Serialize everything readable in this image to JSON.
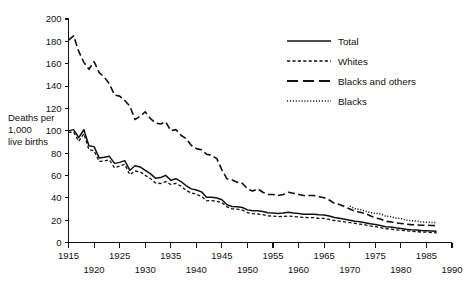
{
  "chart_data": {
    "type": "line",
    "title": "",
    "subtitle": "",
    "xlabel": "",
    "ylabel": "Deaths per 1,000 live births",
    "ylabel_lines": [
      "Deaths per",
      "1,000",
      "live births"
    ],
    "xlim": [
      1915,
      1990
    ],
    "ylim": [
      0,
      200
    ],
    "grid": false,
    "legend_position": "top-right",
    "x_ticks": [
      1915,
      1920,
      1925,
      1930,
      1935,
      1940,
      1945,
      1950,
      1955,
      1960,
      1965,
      1970,
      1975,
      1980,
      1985,
      1990
    ],
    "x_tick_labels_upper": [
      "1915",
      "1925",
      "1935",
      "1945",
      "1955",
      "1965",
      "1975",
      "1985"
    ],
    "x_tick_labels_lower": [
      "1920",
      "1930",
      "1940",
      "1950",
      "1960",
      "1970",
      "1980",
      "1990"
    ],
    "y_ticks": [
      0,
      20,
      40,
      60,
      80,
      100,
      120,
      140,
      160,
      180,
      200
    ],
    "y_tick_labels": [
      "0",
      "20",
      "40",
      "60",
      "80",
      "100",
      "120",
      "140",
      "160",
      "180",
      "200"
    ],
    "series": [
      {
        "name": "Total",
        "line_style": "solid",
        "x": [
          1915,
          1916,
          1917,
          1918,
          1919,
          1920,
          1921,
          1922,
          1923,
          1924,
          1925,
          1926,
          1927,
          1928,
          1929,
          1930,
          1931,
          1932,
          1933,
          1934,
          1935,
          1936,
          1937,
          1938,
          1939,
          1940,
          1941,
          1942,
          1943,
          1944,
          1945,
          1946,
          1947,
          1948,
          1949,
          1950,
          1951,
          1952,
          1953,
          1954,
          1955,
          1956,
          1957,
          1958,
          1959,
          1960,
          1961,
          1962,
          1963,
          1964,
          1965,
          1966,
          1967,
          1968,
          1969,
          1970,
          1971,
          1972,
          1973,
          1974,
          1975,
          1976,
          1977,
          1978,
          1979,
          1980,
          1981,
          1982,
          1983,
          1984,
          1985,
          1986,
          1987
        ],
        "values": [
          99.9,
          101.0,
          93.8,
          100.9,
          86.6,
          85.8,
          75.6,
          76.2,
          77.1,
          70.8,
          71.7,
          73.3,
          64.6,
          68.7,
          67.6,
          64.6,
          61.6,
          57.6,
          58.1,
          60.1,
          55.7,
          57.1,
          54.4,
          51.0,
          48.0,
          47.0,
          45.3,
          40.4,
          40.4,
          39.8,
          38.3,
          33.8,
          32.2,
          32.0,
          31.3,
          29.2,
          28.4,
          28.4,
          27.8,
          26.6,
          26.4,
          26.0,
          26.3,
          27.1,
          26.4,
          26.0,
          25.3,
          25.3,
          25.2,
          24.8,
          24.7,
          23.7,
          22.4,
          21.8,
          20.9,
          20.0,
          19.1,
          18.5,
          17.7,
          16.7,
          16.1,
          15.2,
          14.1,
          13.8,
          13.1,
          12.6,
          11.9,
          11.5,
          11.2,
          10.8,
          10.6,
          10.4,
          10.1
        ]
      },
      {
        "name": "Whites",
        "line_style": "dashed",
        "x": [
          1915,
          1916,
          1917,
          1918,
          1919,
          1920,
          1921,
          1922,
          1923,
          1924,
          1925,
          1926,
          1927,
          1928,
          1929,
          1930,
          1931,
          1932,
          1933,
          1934,
          1935,
          1936,
          1937,
          1938,
          1939,
          1940,
          1941,
          1942,
          1943,
          1944,
          1945,
          1946,
          1947,
          1948,
          1949,
          1950,
          1951,
          1952,
          1953,
          1954,
          1955,
          1956,
          1957,
          1958,
          1959,
          1960,
          1961,
          1962,
          1963,
          1964,
          1965,
          1966,
          1967,
          1968,
          1969,
          1970,
          1971,
          1972,
          1973,
          1974,
          1975,
          1976,
          1977,
          1978,
          1979,
          1980,
          1981,
          1982,
          1983,
          1984,
          1985,
          1986,
          1987
        ],
        "values": [
          98.6,
          99.0,
          90.5,
          97.4,
          83.0,
          82.1,
          72.5,
          73.0,
          73.9,
          66.8,
          68.3,
          70.0,
          60.6,
          64.0,
          63.2,
          60.1,
          57.4,
          53.3,
          52.8,
          54.5,
          51.9,
          52.9,
          50.3,
          46.7,
          44.3,
          43.2,
          41.2,
          37.3,
          37.5,
          36.9,
          35.6,
          31.8,
          30.1,
          29.9,
          28.9,
          26.8,
          25.8,
          25.5,
          25.0,
          23.9,
          23.6,
          23.2,
          23.3,
          23.8,
          23.2,
          22.9,
          22.4,
          22.3,
          22.2,
          21.6,
          21.5,
          20.6,
          19.7,
          19.2,
          18.4,
          17.8,
          17.1,
          16.4,
          15.8,
          14.8,
          14.2,
          13.3,
          12.3,
          12.0,
          11.4,
          11.0,
          10.5,
          10.1,
          9.7,
          9.4,
          9.3,
          8.9,
          8.6
        ]
      },
      {
        "name": "Blacks and others",
        "line_style": "long-dashed",
        "x": [
          1915,
          1916,
          1917,
          1918,
          1919,
          1920,
          1921,
          1922,
          1923,
          1924,
          1925,
          1926,
          1927,
          1928,
          1929,
          1930,
          1931,
          1932,
          1933,
          1934,
          1935,
          1936,
          1937,
          1938,
          1939,
          1940,
          1941,
          1942,
          1943,
          1944,
          1945,
          1946,
          1947,
          1948,
          1949,
          1950,
          1951,
          1952,
          1953,
          1954,
          1955,
          1956,
          1957,
          1958,
          1959,
          1960,
          1961,
          1962,
          1963,
          1964,
          1965,
          1966,
          1967,
          1968,
          1969,
          1970,
          1971,
          1972,
          1973,
          1974,
          1975,
          1976,
          1977,
          1978,
          1979,
          1980,
          1981,
          1982,
          1983,
          1984,
          1985,
          1986,
          1987
        ],
        "values": [
          181.2,
          185.0,
          171.0,
          161.2,
          155.0,
          161.8,
          152.0,
          148.0,
          142.0,
          132.0,
          131.0,
          127.0,
          122.0,
          110.0,
          113.0,
          117.0,
          111.0,
          107.0,
          106.0,
          108.0,
          100.0,
          101.0,
          96.0,
          93.0,
          87.0,
          84.0,
          83.0,
          79.0,
          78.0,
          75.0,
          65.0,
          57.0,
          56.0,
          54.0,
          53.0,
          48.0,
          46.0,
          48.0,
          45.0,
          43.0,
          43.0,
          42.0,
          43.0,
          45.0,
          44.0,
          43.0,
          42.0,
          42.0,
          42.0,
          41.0,
          40.0,
          38.0,
          35.0,
          34.0,
          32.0,
          30.0,
          28.0,
          27.0,
          26.0,
          24.0,
          22.0,
          21.0,
          19.0,
          18.5,
          17.5,
          17.0,
          16.5,
          16.0,
          15.8,
          15.5,
          15.5,
          15.2,
          15.0
        ]
      },
      {
        "name": "Blacks",
        "line_style": "dotted",
        "x": [
          1970,
          1971,
          1972,
          1973,
          1974,
          1975,
          1976,
          1977,
          1978,
          1979,
          1980,
          1981,
          1982,
          1983,
          1984,
          1985,
          1986,
          1987
        ],
        "values": [
          32.6,
          30.3,
          29.6,
          28.1,
          26.8,
          26.2,
          25.5,
          23.6,
          23.1,
          21.8,
          21.4,
          20.0,
          19.6,
          19.2,
          18.4,
          18.2,
          18.0,
          17.9
        ]
      }
    ],
    "legend_entries": [
      {
        "label": "Total",
        "style": "solid"
      },
      {
        "label": "Whites",
        "style": "dashed"
      },
      {
        "label": "Blacks and others",
        "style": "long-dashed"
      },
      {
        "label": "Blacks",
        "style": "dotted"
      }
    ]
  }
}
